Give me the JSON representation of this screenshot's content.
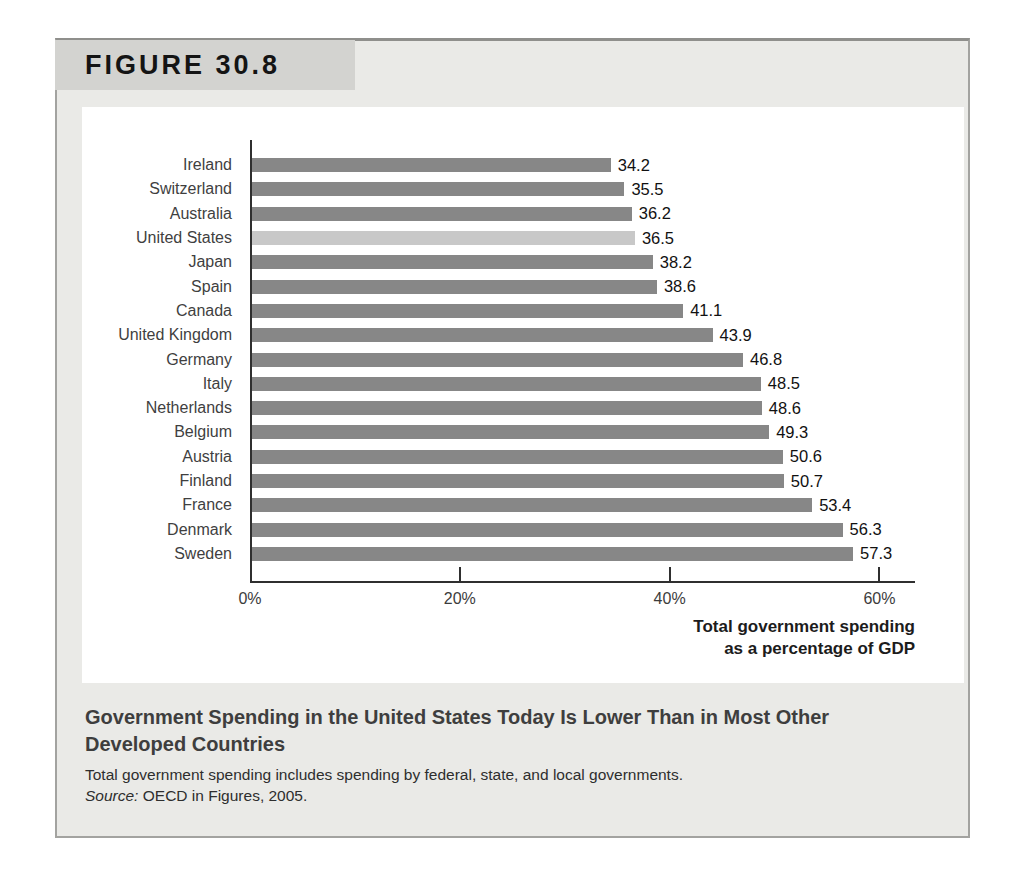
{
  "figure": {
    "label": "FIGURE 30.8",
    "caption_title": "Government Spending in the United States Today Is Lower Than in Most Other Developed Countries",
    "note": "Total government spending includes spending by federal, state, and local governments.",
    "source_label": "Source:",
    "source_text": "OECD in Figures, 2005."
  },
  "chart_data": {
    "type": "bar",
    "orientation": "horizontal",
    "categories": [
      "Ireland",
      "Switzerland",
      "Australia",
      "United States",
      "Japan",
      "Spain",
      "Canada",
      "United Kingdom",
      "Germany",
      "Italy",
      "Netherlands",
      "Belgium",
      "Austria",
      "Finland",
      "France",
      "Denmark",
      "Sweden"
    ],
    "values": [
      34.2,
      35.5,
      36.2,
      36.5,
      38.2,
      38.6,
      41.1,
      43.9,
      46.8,
      48.5,
      48.6,
      49.3,
      50.6,
      50.7,
      53.4,
      56.3,
      57.3
    ],
    "value_labels": [
      "34.2",
      "35.5",
      "36.2",
      "36.5",
      "38.2",
      "38.6",
      "41.1",
      "43.9",
      "46.8",
      "48.5",
      "48.6",
      "49.3",
      "50.6",
      "50.7",
      "53.4",
      "56.3",
      "57.3"
    ],
    "highlight_category": "United States",
    "highlight_index": 3,
    "xlabel_lines": [
      "Total government spending",
      "as a percentage of GDP"
    ],
    "x_tick_labels": [
      "0%",
      "20%",
      "40%",
      "60%"
    ],
    "x_tick_values": [
      0,
      20,
      40,
      60
    ],
    "xlim": [
      0,
      63.2
    ],
    "grid": false,
    "legend": "none",
    "bar_color": "#878787",
    "highlight_bar_color": "#c8c8c8"
  },
  "colors": {
    "panel_bg": "#eaeae7",
    "header_bg": "#d3d3d0",
    "chart_bg": "#ffffff",
    "axis": "#2f2f2f"
  }
}
